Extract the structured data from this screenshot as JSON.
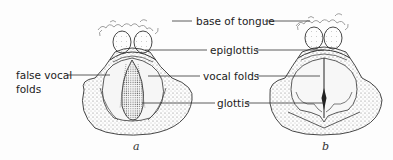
{
  "diagram": {
    "labels": {
      "base_of_tongue": "base of tongue",
      "epiglottis": "epiglottis",
      "false_vocal_folds_line1": "false vocal",
      "false_vocal_folds_line2": "folds",
      "vocal_folds": "vocal folds",
      "glottis": "glottis"
    },
    "panels": [
      {
        "id": "a",
        "caption": "a",
        "state": "glottis open (breathing)"
      },
      {
        "id": "b",
        "caption": "b",
        "state": "glottis closed (phonation)"
      }
    ],
    "colors": {
      "line": "#333333",
      "stipple": "#555555",
      "background": "#fdfdfd"
    }
  }
}
